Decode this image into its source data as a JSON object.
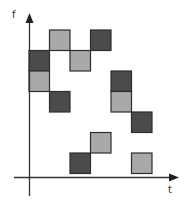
{
  "diagram": {
    "type": "time-frequency-grid",
    "axes": {
      "x_label": "t",
      "y_label": "f"
    },
    "colors": {
      "dark": "#4b4b4b",
      "light": "#a9a9a9",
      "border": "#2e2e2e",
      "axis": "#333333"
    },
    "grid": {
      "origin_x": 29,
      "origin_y": 30,
      "cell": 20.5
    },
    "blocks": [
      {
        "col": 0,
        "row": 1,
        "shade": "dark"
      },
      {
        "col": 0,
        "row": 2,
        "shade": "light"
      },
      {
        "col": 1,
        "row": 0,
        "shade": "light"
      },
      {
        "col": 1,
        "row": 3,
        "shade": "dark"
      },
      {
        "col": 2,
        "row": 1,
        "shade": "light"
      },
      {
        "col": 2,
        "row": 6,
        "shade": "dark"
      },
      {
        "col": 3,
        "row": 0,
        "shade": "dark"
      },
      {
        "col": 3,
        "row": 5,
        "shade": "light"
      },
      {
        "col": 4,
        "row": 2,
        "shade": "dark"
      },
      {
        "col": 4,
        "row": 3,
        "shade": "light"
      },
      {
        "col": 5,
        "row": 4,
        "shade": "dark"
      },
      {
        "col": 5,
        "row": 6,
        "shade": "light"
      }
    ]
  }
}
